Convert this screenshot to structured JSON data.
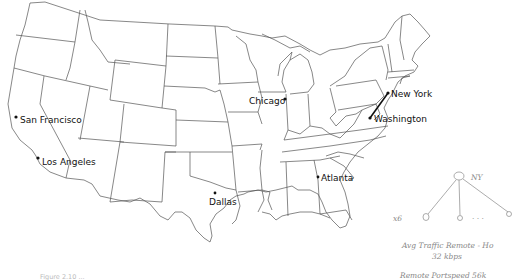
{
  "map": {
    "region": "Contiguous United States",
    "style": "state outline map",
    "cities": [
      {
        "id": "san-francisco",
        "name": "San Francisco"
      },
      {
        "id": "los-angeles",
        "name": "Los Angeles"
      },
      {
        "id": "chicago",
        "name": "Chicago"
      },
      {
        "id": "dallas",
        "name": "Dallas"
      },
      {
        "id": "atlanta",
        "name": "Atlanta"
      },
      {
        "id": "new-york",
        "name": "New York"
      },
      {
        "id": "washington",
        "name": "Washington"
      }
    ],
    "routes": [
      {
        "from": "new-york",
        "to": "washington",
        "style": "bold line"
      }
    ]
  },
  "annotations": {
    "tree_root_label": "NY",
    "tree_leaf_count_label": "x6",
    "tree_ellipsis": ". . .",
    "note_line_1": "Avg Traffic Remote - Ho",
    "note_line_2": "32 kbps",
    "note_line_3": "Remote Portspeed 56k"
  },
  "caption": {
    "text": "Figure 2.10 ..."
  }
}
